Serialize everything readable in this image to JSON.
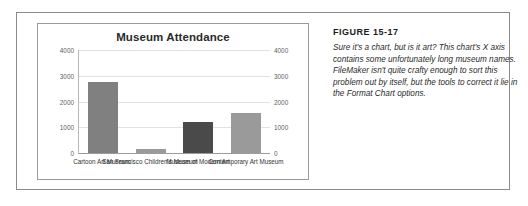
{
  "figure": {
    "number": "FIGURE 15-17",
    "caption": "Sure it's a chart, but is it art? This chart's X axis contains some unfortunately long museum names. FileMaker isn't quite crafty enough to sort this problem out by itself, but the tools to correct it lie in the Format Chart options."
  },
  "chart_data": {
    "type": "bar",
    "title": "Museum Attendance",
    "xlabel": "",
    "ylabel": "",
    "ylim": [
      0,
      4000
    ],
    "yticks": [
      "4000",
      "3000",
      "2000",
      "1000",
      "0"
    ],
    "grid": true,
    "legend": "none",
    "dual_axis": true,
    "categories": [
      "Cartoon Art Museum",
      "San Francisco Children's Museum",
      "Museum of Modern Art",
      "Contemporary Art Museum"
    ],
    "values": [
      2750,
      150,
      1200,
      1550
    ],
    "bar_colors": [
      "#808080",
      "#9a9a9a",
      "#4a4a4a",
      "#9a9a9a"
    ]
  }
}
